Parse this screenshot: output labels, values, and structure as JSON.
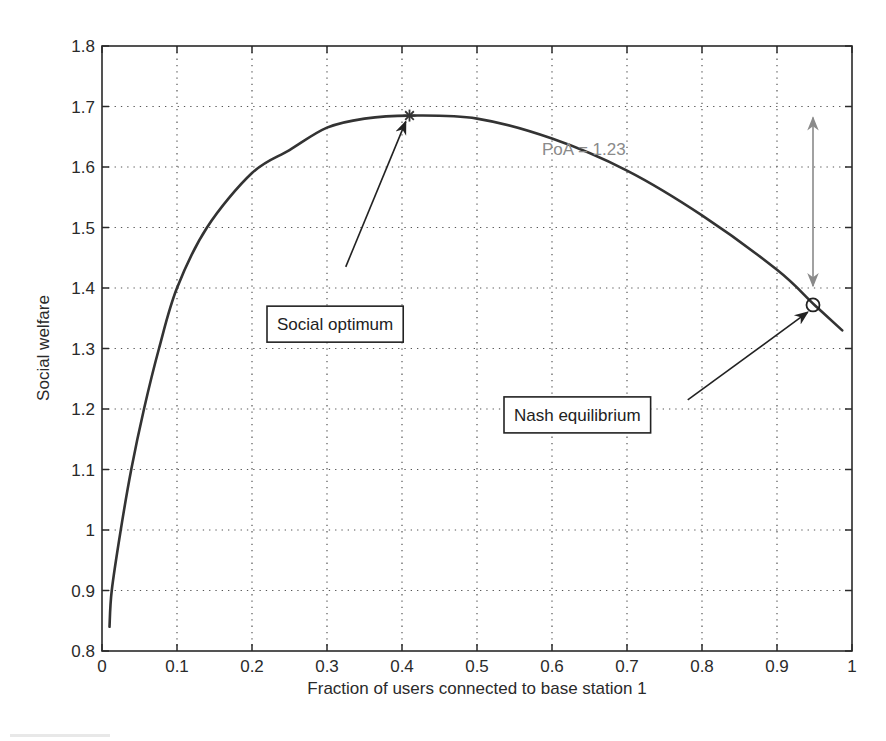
{
  "chart_data": {
    "type": "line",
    "title": "",
    "xlabel": "Fraction of users connected to base station 1",
    "ylabel": "Social welfare",
    "xlim": [
      0,
      1
    ],
    "ylim": [
      0.8,
      1.8
    ],
    "grid": true,
    "grid_style": "dotted",
    "legend": null,
    "xticks": [
      0,
      0.1,
      0.2,
      0.3,
      0.4,
      0.5,
      0.6,
      0.7,
      0.8,
      0.9,
      1
    ],
    "xtick_labels": [
      "0",
      "0.1",
      "0.2",
      "0.3",
      "0.4",
      "0.5",
      "0.6",
      "0.7",
      "0.8",
      "0.9",
      "1"
    ],
    "yticks": [
      0.8,
      0.9,
      1.0,
      1.1,
      1.2,
      1.3,
      1.4,
      1.5,
      1.6,
      1.7,
      1.8
    ],
    "ytick_labels": [
      "0.8",
      "0.9",
      "1",
      "1.1",
      "1.2",
      "1.3",
      "1.4",
      "1.5",
      "1.6",
      "1.7",
      "1.8"
    ],
    "series": [
      {
        "name": "Social welfare",
        "color": "#333333",
        "x": [
          0.01,
          0.013,
          0.025,
          0.039,
          0.056,
          0.076,
          0.1,
          0.14,
          0.2,
          0.25,
          0.3,
          0.35,
          0.41,
          0.5,
          0.6,
          0.7,
          0.8,
          0.9,
          0.95,
          0.987
        ],
        "y": [
          0.84,
          0.9,
          1.0,
          1.1,
          1.2,
          1.3,
          1.4,
          1.5,
          1.59,
          1.628,
          1.665,
          1.68,
          1.685,
          1.68,
          1.647,
          1.594,
          1.52,
          1.43,
          1.372,
          1.33
        ]
      }
    ],
    "markers": [
      {
        "name": "Social optimum",
        "symbol": "star",
        "x": 0.41,
        "y": 1.685
      },
      {
        "name": "Nash equilibrium",
        "symbol": "circle",
        "x": 0.948,
        "y": 1.372
      }
    ],
    "annotations": [
      {
        "text": "Social optimum",
        "boxed": true,
        "box_x": 0.22,
        "box_y": 1.37,
        "arrow_from": [
          0.325,
          1.435
        ],
        "arrow_to": [
          0.405,
          1.675
        ]
      },
      {
        "text": "Nash equilibrium",
        "boxed": true,
        "box_x": 0.536,
        "box_y": 1.22,
        "arrow_from": [
          0.781,
          1.215
        ],
        "arrow_to": [
          0.941,
          1.36
        ]
      },
      {
        "text": "PoA = 1.23",
        "boxed": false,
        "color": "#8a8a8a",
        "x": 0.72,
        "y": 1.63
      },
      {
        "text": "",
        "type": "double-arrow",
        "color": "#8a8a8a",
        "x": 0.948,
        "y_from": 1.4,
        "y_to": 1.685
      }
    ]
  },
  "layout": {
    "plot_left": 102,
    "plot_right": 852,
    "plot_top": 46,
    "plot_bottom": 651
  }
}
